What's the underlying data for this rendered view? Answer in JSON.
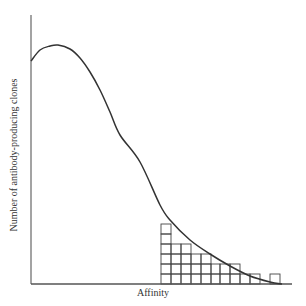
{
  "figure": {
    "x_axis_label": "Affinity",
    "y_axis_label": "Number of antibody-producing clones",
    "colors": {
      "line": "#333333",
      "axis": "#555555",
      "grid": "#444444",
      "background": "#ffffff"
    }
  },
  "chart_data": {
    "type": "line",
    "title": "",
    "xlabel": "Affinity",
    "ylabel": "Number of antibody-producing clones",
    "grid": false,
    "curve_points_px": [
      [
        31,
        61
      ],
      [
        40,
        50
      ],
      [
        50,
        46
      ],
      [
        58,
        45
      ],
      [
        70,
        49
      ],
      [
        80,
        58
      ],
      [
        90,
        72
      ],
      [
        100,
        90
      ],
      [
        110,
        112
      ],
      [
        120,
        135
      ],
      [
        140,
        162
      ],
      [
        160,
        205
      ],
      [
        170,
        220
      ],
      [
        190,
        240
      ],
      [
        210,
        254
      ],
      [
        230,
        266
      ],
      [
        250,
        276
      ],
      [
        270,
        282
      ],
      [
        282,
        284
      ]
    ],
    "histogram": {
      "cell_size_px": 10,
      "columns": [
        {
          "x": 161,
          "count": 6
        },
        {
          "x": 171,
          "count": 4
        },
        {
          "x": 181,
          "count": 4
        },
        {
          "x": 191,
          "count": 3
        },
        {
          "x": 201,
          "count": 3
        },
        {
          "x": 211,
          "count": 2
        },
        {
          "x": 220,
          "count": 2
        },
        {
          "x": 230,
          "count": 2
        },
        {
          "x": 240,
          "count": 1
        },
        {
          "x": 250,
          "count": 1
        },
        {
          "x": 260,
          "count": 0
        },
        {
          "x": 270,
          "count": 1
        }
      ]
    },
    "axes": {
      "origin_px": [
        31,
        284
      ],
      "y_top_px": 15,
      "x_end_px": 292
    }
  }
}
